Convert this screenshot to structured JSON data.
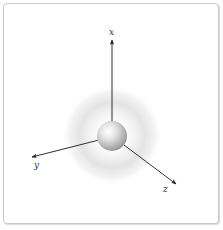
{
  "diagram": {
    "axes": [
      {
        "name": "x",
        "label": "x",
        "direction": "up"
      },
      {
        "name": "y",
        "label": "y",
        "direction": "lower-left"
      },
      {
        "name": "z",
        "label": "z",
        "direction": "lower-right"
      }
    ],
    "colors": {
      "axis": "#1a1a1a",
      "label": "#333333",
      "cloud": "#d6d6d6",
      "sphere_highlight": "#ffffff",
      "sphere_shadow": "#9a9a9a",
      "frame_border": "#c8c8c8"
    }
  }
}
